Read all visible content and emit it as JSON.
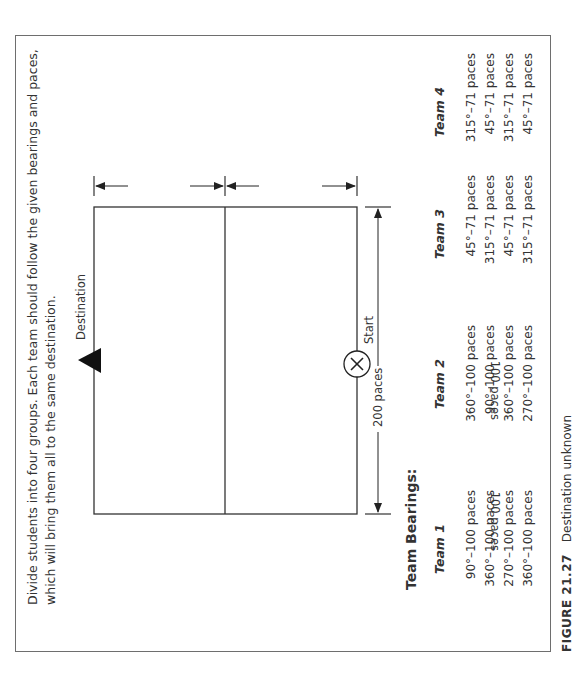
{
  "instructions": "Divide students into four groups. Each team should follow the given bearings and paces, which will bring them all to the same destination.",
  "diagram": {
    "destination_label": "Destination",
    "start_label": "Start",
    "start_marker": "X",
    "width_left_label": "100 paces",
    "width_right_label": "100 paces",
    "length_label": "200 paces",
    "icons": {
      "destination": "triangle-marker",
      "start": "circled-x-marker"
    }
  },
  "bearings": {
    "title": "Team Bearings:",
    "teams": [
      {
        "name": "Team 1",
        "rows": [
          "90°–100 paces",
          "360°–100 paces",
          "270°–100 paces",
          "360°–100 paces"
        ]
      },
      {
        "name": "Team 2",
        "rows": [
          "360°–100 paces",
          "90°–100 paces",
          "360°–100 paces",
          "270°–100 paces"
        ]
      },
      {
        "name": "Team 3",
        "rows": [
          "45°–71 paces",
          "315°–71 paces",
          "45°–71 paces",
          "315°–71 paces"
        ]
      },
      {
        "name": "Team 4",
        "rows": [
          "315°–71 paces",
          "45°–71 paces",
          "315°–71 paces",
          "45°–71 paces"
        ]
      }
    ]
  },
  "caption": {
    "figure_number": "FIGURE 21.27",
    "title": "Destination unknown"
  }
}
